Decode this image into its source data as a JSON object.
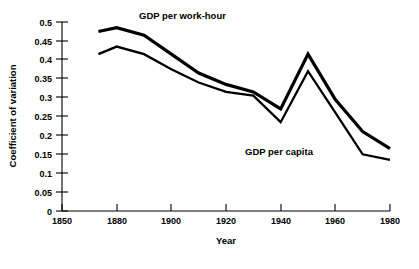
{
  "chart_data": {
    "type": "line",
    "title": "",
    "xlabel": "Year",
    "ylabel": "Coefficient of variation",
    "grid": false,
    "legend_position": "inline-annotation",
    "x_tick_labels": [
      "1850",
      "1880",
      "1900",
      "1920",
      "1940",
      "1960",
      "1980"
    ],
    "x_tick_values": [
      1850,
      1880,
      1900,
      1920,
      1940,
      1960,
      1980
    ],
    "x_axis_note": "tick labels are evenly spaced on the axis although year intervals are unequal (1850-1880 spans 30 years, remaining intervals span 20 years)",
    "y_tick_labels": [
      "0",
      "0.05",
      "0.1",
      "0.15",
      "0.2",
      "0.25",
      "0.3",
      "0.35",
      "0.4",
      "0.45",
      "0.5"
    ],
    "y_tick_values": [
      0,
      0.05,
      0.1,
      0.15,
      0.2,
      0.25,
      0.3,
      0.35,
      0.4,
      0.45,
      0.5
    ],
    "ylim": [
      0,
      0.5
    ],
    "series": [
      {
        "name": "GDP per work-hour",
        "color": "#000000",
        "x": [
          1870,
          1880,
          1890,
          1900,
          1910,
          1920,
          1930,
          1940,
          1950,
          1960,
          1970,
          1980
        ],
        "values": [
          0.475,
          0.485,
          0.465,
          0.415,
          0.365,
          0.335,
          0.315,
          0.27,
          0.415,
          0.295,
          0.21,
          0.165
        ]
      },
      {
        "name": "GDP per capita",
        "color": "#000000",
        "x": [
          1870,
          1880,
          1890,
          1900,
          1910,
          1920,
          1930,
          1940,
          1950,
          1960,
          1970,
          1980
        ],
        "values": [
          0.415,
          0.435,
          0.415,
          0.375,
          0.34,
          0.315,
          0.305,
          0.235,
          0.37,
          0.26,
          0.15,
          0.135
        ]
      }
    ],
    "annotations": [
      {
        "text": "GDP per work-hour",
        "x_px": 139,
        "y_px": 19
      },
      {
        "text": "GDP per capita",
        "x_px": 245,
        "y_px": 155
      }
    ]
  }
}
